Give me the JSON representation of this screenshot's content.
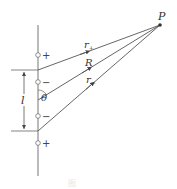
{
  "diagram": {
    "point_label": "P",
    "line_labels": {
      "r_plus": "r",
      "r_plus_sub": "+",
      "R": "R",
      "r_minus": "r",
      "r_minus_sub": "−"
    },
    "angle_label": "θ",
    "length_label": "l",
    "charges": [
      {
        "sign": "+"
      },
      {
        "sign": "−"
      },
      {
        "sign": "−"
      },
      {
        "sign": "+"
      }
    ],
    "caption": "图",
    "colors": {
      "line": "#555555",
      "point": "#333333"
    }
  }
}
